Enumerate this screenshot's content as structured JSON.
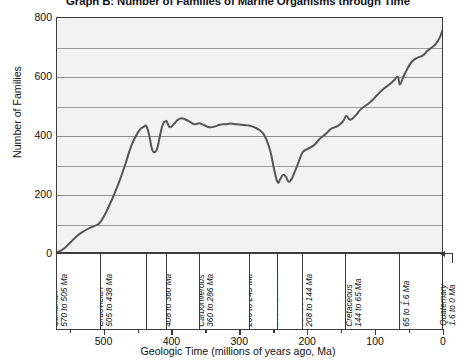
{
  "chart_data": {
    "type": "line",
    "title": "Graph B: Number of Families of Marine Organisms through Time",
    "xlabel": "Geologic Time (millions of years ago, Ma)",
    "ylabel": "Number of Families",
    "xlim": [
      570,
      0
    ],
    "ylim": [
      0,
      800
    ],
    "x_major_ticks": [
      500,
      400,
      300,
      200,
      100,
      0
    ],
    "x_minor_ticks": [
      550,
      450,
      350,
      250,
      150,
      50
    ],
    "x_tick_labels": [
      "500",
      "400",
      "300",
      "200",
      "100",
      "0"
    ],
    "y_major_ticks": [
      0,
      200,
      400,
      600,
      800
    ],
    "y_minor_ticks": [
      100,
      300,
      500,
      700
    ],
    "y_tick_labels": [
      "0",
      "200",
      "400",
      "600",
      "800"
    ],
    "grid": "horizontal",
    "legend": "none",
    "x_axis_direction": "reversed",
    "series": [
      {
        "name": "Number of families of marine organisms",
        "color": "#555555",
        "x": [
          570,
          560,
          550,
          540,
          530,
          520,
          510,
          505,
          498,
          490,
          480,
          470,
          460,
          450,
          443,
          438,
          434,
          430,
          426,
          422,
          418,
          414,
          410,
          408,
          404,
          398,
          392,
          386,
          380,
          374,
          368,
          362,
          360,
          354,
          346,
          338,
          330,
          322,
          314,
          306,
          298,
          290,
          286,
          280,
          272,
          264,
          256,
          250,
          245,
          241,
          237,
          233,
          229,
          225,
          221,
          216,
          212,
          208,
          202,
          196,
          190,
          184,
          178,
          172,
          166,
          160,
          154,
          148,
          144,
          138,
          130,
          122,
          114,
          106,
          98,
          90,
          82,
          74,
          68,
          65,
          60,
          54,
          48,
          42,
          36,
          30,
          24,
          18,
          12,
          6,
          2,
          0
        ],
        "y": [
          5,
          18,
          40,
          62,
          78,
          90,
          100,
          112,
          140,
          180,
          235,
          300,
          370,
          415,
          430,
          432,
          400,
          355,
          345,
          360,
          405,
          440,
          450,
          448,
          430,
          440,
          455,
          460,
          455,
          448,
          440,
          442,
          443,
          438,
          430,
          432,
          438,
          440,
          442,
          440,
          438,
          436,
          435,
          430,
          420,
          400,
          350,
          285,
          243,
          255,
          268,
          262,
          245,
          252,
          272,
          300,
          325,
          345,
          355,
          362,
          372,
          388,
          400,
          412,
          425,
          430,
          438,
          452,
          468,
          455,
          470,
          492,
          505,
          520,
          540,
          558,
          572,
          588,
          600,
          575,
          600,
          628,
          650,
          662,
          668,
          675,
          690,
          700,
          712,
          735,
          760,
          772
        ]
      }
    ],
    "periods": [
      {
        "name": "Cambrian",
        "range": "570 to 505 Ma",
        "start": 570,
        "end": 505
      },
      {
        "name": "Ordovician",
        "range": "505 to 438 Ma",
        "start": 505,
        "end": 438
      },
      {
        "name": "Silurian",
        "range": "438 to 408 Ma",
        "start": 438,
        "end": 408
      },
      {
        "name": "Devonian",
        "range": "408 to 360 Ma",
        "start": 408,
        "end": 360
      },
      {
        "name": "Carboniferous",
        "range": "360 to 286 Ma",
        "start": 360,
        "end": 286
      },
      {
        "name": "Permian",
        "range": "286 to 245 Ma",
        "start": 286,
        "end": 245
      },
      {
        "name": "Triassic",
        "range": "245 to 208 Ma",
        "start": 245,
        "end": 208
      },
      {
        "name": "Jurassic",
        "range": "208 to 144 Ma",
        "start": 208,
        "end": 144
      },
      {
        "name": "Cretaceous",
        "range": "144 to 65 Ma",
        "start": 144,
        "end": 65
      },
      {
        "name": "Tertiary",
        "range": "65 to 1.6 Ma",
        "start": 65,
        "end": 1.6
      }
    ],
    "callout": {
      "name": "Quaternary",
      "range": "1.6 to 0 Ma"
    },
    "colors": {
      "line": "#555555",
      "frame": "#3c3c3c",
      "grid": "#8d8d8d",
      "plot_background": "#f2f2f2",
      "page_background": "#ffffff",
      "text": "#111111"
    }
  }
}
